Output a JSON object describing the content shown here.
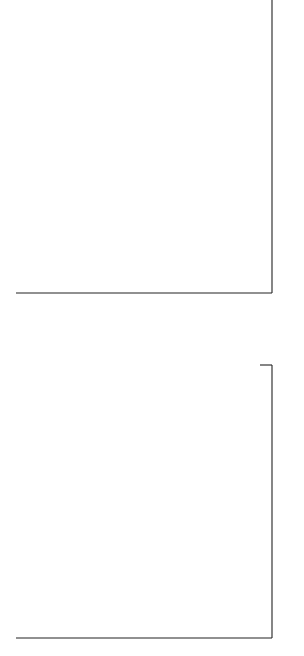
{
  "chart_data": [
    {
      "type": "line",
      "panel": "right",
      "title": "",
      "xlabel": "",
      "ylabel": "Percent",
      "ylim": [
        5,
        11
      ],
      "yticks": [
        "5",
        "6",
        "7",
        "8",
        "9",
        "10",
        "11"
      ],
      "x_ticks": [
        {
          "month": "Dec",
          "year": "69"
        },
        {
          "month": "Mar",
          "year": "70"
        },
        {
          "month": "Jun",
          "year": "70"
        },
        {
          "month": "Sept",
          "year": "70"
        },
        {
          "month": "Dec",
          "year": "70"
        },
        {
          "month": "Mar",
          "year": "71"
        }
      ],
      "x_months": [
        0,
        1,
        2,
        3,
        4,
        5,
        6,
        7,
        8,
        9,
        10,
        11,
        12,
        13,
        14,
        15,
        16,
        17
      ],
      "series": [
        {
          "name": "U.K. Domestic Bond",
          "style": "solid",
          "values": [
            10.7,
            10.5,
            10.3,
            10.0,
            10.5,
            10.8,
            11.0,
            11.0,
            10.7,
            10.5,
            10.3,
            10.0,
            10.4,
            10.8,
            10.6,
            10.6,
            10.3,
            10.2
          ]
        },
        {
          "name": "International Dollar Bond",
          "superscript": "d, e",
          "style": "dotted",
          "values": [
            8.2,
            8.2,
            8.3,
            8.3,
            9.2,
            9.5,
            9.2,
            8.9,
            9.0,
            8.6,
            8.6,
            8.5,
            8.2,
            8.0,
            7.8,
            7.8,
            7.5,
            8.0,
            8.2
          ]
        },
        {
          "name": "International Swiss Franc Bond",
          "superscript": "d, e",
          "style": "dashed",
          "values": [
            6.0,
            6.0,
            6.05,
            6.1,
            6.2,
            6.3,
            6.4,
            6.0,
            5.9,
            6.0,
            5.9,
            5.85,
            5.8,
            5.7,
            5.6,
            5.5,
            5.4
          ]
        }
      ]
    },
    {
      "type": "line",
      "panel": "left",
      "title": "",
      "xlabel": "",
      "ylabel": "",
      "ylim": [
        5,
        11
      ],
      "yticks": [
        "5",
        "6",
        "7",
        "8",
        "9",
        "10",
        "11"
      ],
      "x_ticks": [
        {
          "month": "Dec",
          "year": "69"
        },
        {
          "month": "Mar",
          "year": "70"
        },
        {
          "month": "Jun",
          "year": "70"
        },
        {
          "month": "Sept",
          "year": "70"
        },
        {
          "month": "Dec",
          "year": "70"
        },
        {
          "month": "Mar",
          "year": "71"
        }
      ],
      "series": [
        {
          "name": "Euro-dollar",
          "superscript": "a",
          "style": "dotted",
          "points": [
            [
              0,
              11.0
            ],
            [
              1,
              10.6
            ],
            [
              2,
              10.2
            ],
            [
              2.4,
              10.1
            ],
            [
              3,
              9.4
            ],
            [
              4,
              9.5
            ],
            [
              5,
              9.9
            ],
            [
              6,
              9.8
            ],
            [
              7.5,
              9.1
            ],
            [
              8.5,
              9.2
            ],
            [
              10,
              8.6
            ],
            [
              11,
              8.0
            ],
            [
              12,
              7.6
            ],
            [
              13,
              7.0
            ],
            [
              14,
              6.6
            ],
            [
              15,
              6.2
            ],
            [
              16.4,
              7.0
            ]
          ]
        },
        {
          "name": "U.K. Prime",
          "superscript": "b",
          "style": "solid",
          "points": [
            [
              0,
              9.0
            ],
            [
              2.5,
              9.0
            ],
            [
              5,
              8.0
            ],
            [
              15,
              8.0
            ],
            [
              16.4,
              7.0
            ]
          ]
        },
        {
          "name": "Swiss Prime",
          "superscript": "c",
          "style": "dashed",
          "points": [
            [
              0,
              6.5
            ],
            [
              2.5,
              6.5
            ],
            [
              3.5,
              7.0
            ],
            [
              16.4,
              7.0
            ]
          ]
        }
      ]
    }
  ],
  "right_panel": {
    "y_axis_label": "Percent",
    "series_labels": {
      "uk_domestic": "U.K. Domestic Bond",
      "intl_dollar": "International Dollar Bond",
      "intl_dollar_sup": "d, e",
      "intl_swiss": "International Swiss Franc Bond",
      "intl_swiss_sup": "d, e"
    }
  },
  "left_panel": {
    "series_labels": {
      "eurodollar": "Euro-dollar",
      "eurodollar_sup": "a",
      "uk_prime": "U.K. Prime",
      "uk_prime_sup": "b",
      "swiss_prime": "Swiss Prime",
      "swiss_prime_sup": "c"
    }
  },
  "ticks": {
    "values": [
      "11",
      "10",
      "9",
      "8",
      "7",
      "6",
      "5"
    ],
    "times": [
      {
        "month": "Dec",
        "year": "69"
      },
      {
        "month": "Mar",
        "year": "70"
      },
      {
        "month": "Jun",
        "year": "70"
      },
      {
        "month": "Sept",
        "year": "70"
      },
      {
        "month": "Dec",
        "year": "70"
      },
      {
        "month": "Mar",
        "year": "71"
      }
    ]
  }
}
